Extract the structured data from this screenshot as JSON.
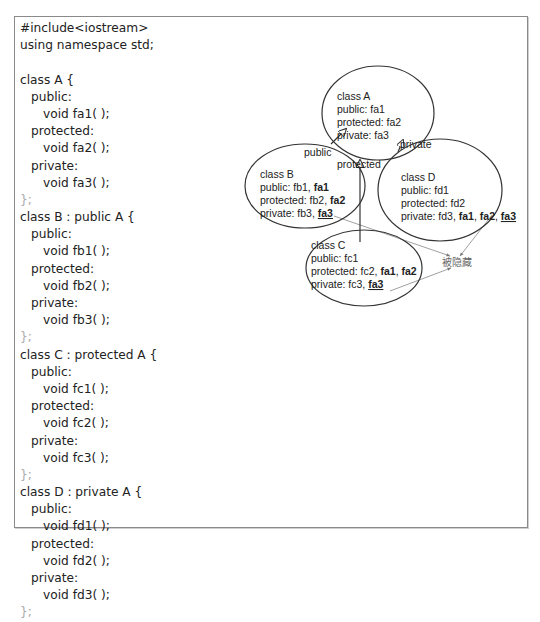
{
  "code": {
    "lines": [
      "#include<iostream>",
      "using namespace std;",
      "",
      "class A {",
      "public:",
      "void fa1( );",
      "protected:",
      "void fa2( );",
      "private:",
      "void fa3( );",
      "};",
      "class B : public A {",
      "public:",
      "void fb1( );",
      "protected:",
      "void fb2( );",
      "private:",
      "void fb3( );",
      "};",
      "class C : protected A {",
      "public:",
      "void fc1( );",
      "protected:",
      "void fc2( );",
      "private:",
      "void fc3( );",
      "};",
      "class D : private A {",
      "public:",
      "void fd1( );",
      "protected:",
      "void fd2( );",
      "private:",
      "void fd3( );",
      "};"
    ]
  },
  "diagram": {
    "classA": {
      "title": "class A",
      "public": "public:  fa1",
      "protected": "protected: fa2",
      "private": "private: fa3"
    },
    "classB": {
      "title": "class B",
      "public_prefix": "public:  fb1, ",
      "public_inherited": "fa1",
      "protected_prefix": "protected: fb2, ",
      "protected_inherited": "fa2",
      "private_prefix": "private: fb3, ",
      "private_hidden": "fa3"
    },
    "classC": {
      "title": "class C",
      "public": "public:  fc1",
      "protected_prefix": "protected: fc2, ",
      "protected_inherited_1": "fa1",
      "protected_sep": ", ",
      "protected_inherited_2": "fa2",
      "private_prefix": "private: fc3, ",
      "private_hidden": "fa3"
    },
    "classD": {
      "title": "class D",
      "public": "public:  fd1",
      "protected": "protected: fd2",
      "private_prefix": "private: fd3, ",
      "private_inherited_1": "fa1",
      "sep1": ", ",
      "private_inherited_2": "fa2",
      "sep2": ", ",
      "private_hidden": "fa3"
    },
    "edges": {
      "public_label": "public",
      "protected_label": "protected",
      "private_label": "private"
    },
    "hidden_label": "被隐藏"
  }
}
